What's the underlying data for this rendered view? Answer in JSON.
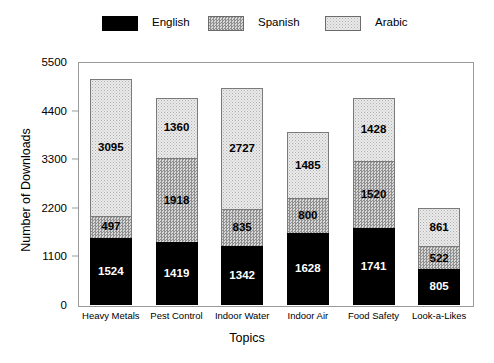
{
  "chart_data": {
    "type": "bar",
    "subtype": "stacked-vertical",
    "title": "",
    "xlabel": "Topics",
    "ylabel": "Number of Downloads",
    "categories": [
      "Heavy Metals",
      "Pest Control",
      "Indoor Water",
      "Indoor Air",
      "Food Safety",
      "Look-a-Likes"
    ],
    "series": [
      {
        "name": "English",
        "values": [
          1524,
          1419,
          1342,
          1628,
          1741,
          805
        ]
      },
      {
        "name": "Spanish",
        "values": [
          497,
          1918,
          835,
          800,
          1520,
          522
        ]
      },
      {
        "name": "Arabic",
        "values": [
          3095,
          1360,
          2727,
          1485,
          1428,
          861
        ]
      }
    ],
    "totals": [
      5116,
      4697,
      4904,
      3913,
      4689,
      2188
    ],
    "ylim": [
      0,
      5500
    ],
    "yticks": [
      0,
      1100,
      2200,
      3300,
      4400,
      5500
    ],
    "ytick_labels": [
      "0",
      "1100",
      "2200",
      "3300",
      "4400",
      "5500"
    ],
    "grid": false,
    "legend_position": "top",
    "stack_order_bottom_to_top": [
      "English",
      "Spanish",
      "Arabic"
    ]
  },
  "legend": {
    "items": [
      {
        "label": "English",
        "swatch": "solid-black-swatch",
        "fill": "#000000"
      },
      {
        "label": "Spanish",
        "swatch": "dense-dotted-gray-swatch",
        "fill": "#b9b9b9"
      },
      {
        "label": "Arabic",
        "swatch": "sparse-dotted-light-swatch",
        "fill": "#eaeaea"
      }
    ]
  },
  "axes": {
    "y_title": "Number of Downloads",
    "x_title": "Topics"
  }
}
